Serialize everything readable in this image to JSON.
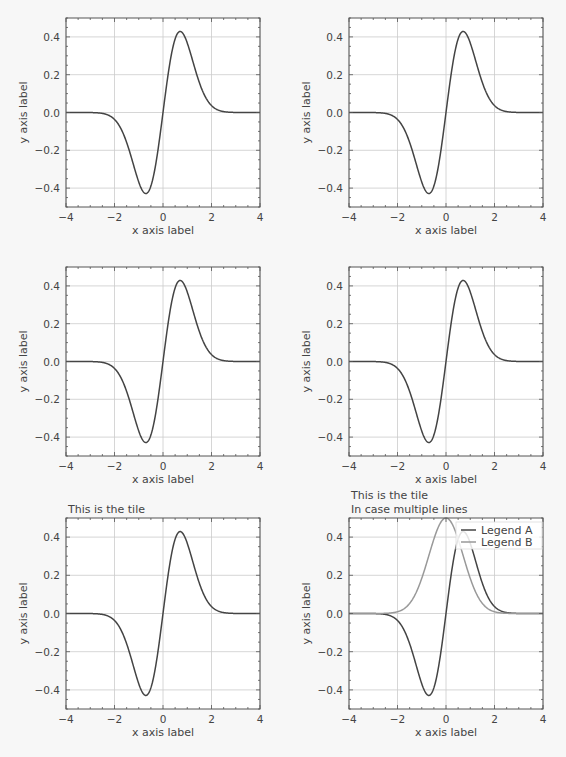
{
  "figure": {
    "background": "#f7f7f7",
    "plot_background": "#ffffff",
    "frame_color": "#555555",
    "grid_color": "#cccccc",
    "line_color_a": "#444444",
    "line_color_b": "#999999"
  },
  "chart_data": [
    {
      "type": "line",
      "position": "row1-col1",
      "title": [],
      "xlabel": "x axis label",
      "ylabel": "y axis label",
      "xlim": [
        -4,
        4
      ],
      "ylim": [
        -0.5,
        0.5
      ],
      "xticks": [
        -4,
        -2,
        0,
        2,
        4
      ],
      "xtick_labels": [
        "−4",
        "−2",
        "0",
        "2",
        "4"
      ],
      "yticks": [
        -0.4,
        -0.2,
        0.0,
        0.2,
        0.4
      ],
      "ytick_labels": [
        "−0.4",
        "−0.2",
        "0.0",
        "0.2",
        "0.4"
      ],
      "grid": true,
      "series": [
        {
          "name": "",
          "formula": "x*exp(-x^2)",
          "x": [
            -4,
            -3,
            -2.5,
            -2,
            -1.5,
            -1,
            -0.71,
            -0.5,
            0,
            0.5,
            0.71,
            1,
            1.5,
            2,
            2.5,
            3,
            4
          ],
          "y": [
            0,
            0,
            -0.005,
            -0.037,
            -0.158,
            -0.368,
            -0.429,
            -0.389,
            0,
            0.389,
            0.429,
            0.368,
            0.158,
            0.037,
            0.005,
            0,
            0
          ]
        }
      ],
      "legend": null
    },
    {
      "type": "line",
      "position": "row1-col2",
      "title": [],
      "xlabel": "x axis label",
      "ylabel": "y axis label",
      "xlim": [
        -4,
        4
      ],
      "ylim": [
        -0.5,
        0.5
      ],
      "xticks": [
        -4,
        -2,
        0,
        2,
        4
      ],
      "xtick_labels": [
        "−4",
        "−2",
        "0",
        "2",
        "4"
      ],
      "yticks": [
        -0.4,
        -0.2,
        0.0,
        0.2,
        0.4
      ],
      "ytick_labels": [
        "−0.4",
        "−0.2",
        "0.0",
        "0.2",
        "0.4"
      ],
      "grid": true,
      "series": [
        {
          "name": "",
          "formula": "x*exp(-x^2)",
          "x": [
            -4,
            -3,
            -2.5,
            -2,
            -1.5,
            -1,
            -0.71,
            -0.5,
            0,
            0.5,
            0.71,
            1,
            1.5,
            2,
            2.5,
            3,
            4
          ],
          "y": [
            0,
            0,
            -0.005,
            -0.037,
            -0.158,
            -0.368,
            -0.429,
            -0.389,
            0,
            0.389,
            0.429,
            0.368,
            0.158,
            0.037,
            0.005,
            0,
            0
          ]
        }
      ],
      "legend": null
    },
    {
      "type": "line",
      "position": "row2-col1",
      "title": [],
      "xlabel": "x axis label",
      "ylabel": "y axis label",
      "xlim": [
        -4,
        4
      ],
      "ylim": [
        -0.5,
        0.5
      ],
      "xticks": [
        -4,
        -2,
        0,
        2,
        4
      ],
      "xtick_labels": [
        "−4",
        "−2",
        "0",
        "2",
        "4"
      ],
      "yticks": [
        -0.4,
        -0.2,
        0.0,
        0.2,
        0.4
      ],
      "ytick_labels": [
        "−0.4",
        "−0.2",
        "0.0",
        "0.2",
        "0.4"
      ],
      "grid": true,
      "series": [
        {
          "name": "",
          "formula": "x*exp(-x^2)",
          "x": [
            -4,
            -3,
            -2.5,
            -2,
            -1.5,
            -1,
            -0.71,
            -0.5,
            0,
            0.5,
            0.71,
            1,
            1.5,
            2,
            2.5,
            3,
            4
          ],
          "y": [
            0,
            0,
            -0.005,
            -0.037,
            -0.158,
            -0.368,
            -0.429,
            -0.389,
            0,
            0.389,
            0.429,
            0.368,
            0.158,
            0.037,
            0.005,
            0,
            0
          ]
        }
      ],
      "legend": null
    },
    {
      "type": "line",
      "position": "row2-col2",
      "title": [],
      "xlabel": "x axis label",
      "ylabel": "y axis label",
      "xlim": [
        -4,
        4
      ],
      "ylim": [
        -0.5,
        0.5
      ],
      "xticks": [
        -4,
        -2,
        0,
        2,
        4
      ],
      "xtick_labels": [
        "−4",
        "−2",
        "0",
        "2",
        "4"
      ],
      "yticks": [
        -0.4,
        -0.2,
        0.0,
        0.2,
        0.4
      ],
      "ytick_labels": [
        "−0.4",
        "−0.2",
        "0.0",
        "0.2",
        "0.4"
      ],
      "grid": true,
      "series": [
        {
          "name": "",
          "formula": "x*exp(-x^2)",
          "x": [
            -4,
            -3,
            -2.5,
            -2,
            -1.5,
            -1,
            -0.71,
            -0.5,
            0,
            0.5,
            0.71,
            1,
            1.5,
            2,
            2.5,
            3,
            4
          ],
          "y": [
            0,
            0,
            -0.005,
            -0.037,
            -0.158,
            -0.368,
            -0.429,
            -0.389,
            0,
            0.389,
            0.429,
            0.368,
            0.158,
            0.037,
            0.005,
            0,
            0
          ]
        }
      ],
      "legend": null
    },
    {
      "type": "line",
      "position": "row3-col1",
      "title": [
        "This is the tile"
      ],
      "xlabel": "x axis label",
      "ylabel": "y axis label",
      "xlim": [
        -4,
        4
      ],
      "ylim": [
        -0.5,
        0.5
      ],
      "xticks": [
        -4,
        -2,
        0,
        2,
        4
      ],
      "xtick_labels": [
        "−4",
        "−2",
        "0",
        "2",
        "4"
      ],
      "yticks": [
        -0.4,
        -0.2,
        0.0,
        0.2,
        0.4
      ],
      "ytick_labels": [
        "−0.4",
        "−0.2",
        "0.0",
        "0.2",
        "0.4"
      ],
      "grid": true,
      "series": [
        {
          "name": "",
          "formula": "x*exp(-x^2)",
          "x": [
            -4,
            -3,
            -2.5,
            -2,
            -1.5,
            -1,
            -0.71,
            -0.5,
            0,
            0.5,
            0.71,
            1,
            1.5,
            2,
            2.5,
            3,
            4
          ],
          "y": [
            0,
            0,
            -0.005,
            -0.037,
            -0.158,
            -0.368,
            -0.429,
            -0.389,
            0,
            0.389,
            0.429,
            0.368,
            0.158,
            0.037,
            0.005,
            0,
            0
          ]
        }
      ],
      "legend": null
    },
    {
      "type": "line",
      "position": "row3-col2",
      "title": [
        "This is the tile",
        "In case multiple lines"
      ],
      "xlabel": "x axis label",
      "ylabel": "y axis label",
      "xlim": [
        -4,
        4
      ],
      "ylim": [
        -0.5,
        0.5
      ],
      "xticks": [
        -4,
        -2,
        0,
        2,
        4
      ],
      "xtick_labels": [
        "−4",
        "−2",
        "0",
        "2",
        "4"
      ],
      "yticks": [
        -0.4,
        -0.2,
        0.0,
        0.2,
        0.4
      ],
      "ytick_labels": [
        "−0.4",
        "−0.2",
        "0.0",
        "0.2",
        "0.4"
      ],
      "grid": true,
      "series": [
        {
          "name": "Legend A",
          "formula": "x*exp(-x^2)",
          "x": [
            -4,
            -3,
            -2.5,
            -2,
            -1.5,
            -1,
            -0.71,
            -0.5,
            0,
            0.5,
            0.71,
            1,
            1.5,
            2,
            2.5,
            3,
            4
          ],
          "y": [
            0,
            0,
            -0.005,
            -0.037,
            -0.158,
            -0.368,
            -0.429,
            -0.389,
            0,
            0.389,
            0.429,
            0.368,
            0.158,
            0.037,
            0.005,
            0,
            0
          ]
        },
        {
          "name": "Legend B",
          "formula": "0.5*exp(-x^2)",
          "x": [
            -4,
            -3,
            -2.5,
            -2,
            -1.5,
            -1,
            -0.5,
            0,
            0.5,
            1,
            1.5,
            2,
            2.5,
            3,
            4
          ],
          "y": [
            0,
            0,
            0.001,
            0.009,
            0.053,
            0.184,
            0.389,
            0.5,
            0.389,
            0.184,
            0.053,
            0.009,
            0.001,
            0,
            0
          ]
        }
      ],
      "legend": {
        "position": "upper right",
        "entries": [
          "Legend A",
          "Legend B"
        ]
      }
    }
  ]
}
